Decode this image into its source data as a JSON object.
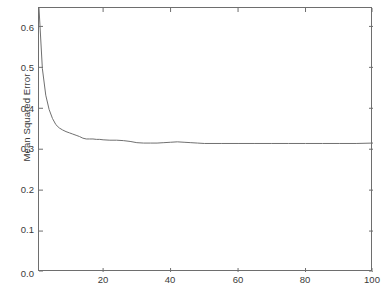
{
  "chart_data": {
    "type": "line",
    "title": "",
    "xlabel": "Number of Models in Ensemble",
    "ylabel": "Mean Squared Error",
    "xlim": [
      1,
      100
    ],
    "ylim": [
      0.0,
      0.645
    ],
    "grid": false,
    "legend": null,
    "line_color": "#707070",
    "line_width": 1,
    "xticks": [
      20,
      40,
      60,
      80,
      100
    ],
    "xtick_labels": [
      "20",
      "40",
      "60",
      "80",
      "100"
    ],
    "yticks": [
      0.0,
      0.1,
      0.2,
      0.3,
      0.4,
      0.5,
      0.6
    ],
    "ytick_labels": [
      "0.0",
      "0.1",
      "0.2",
      "0.3",
      "0.4",
      "0.5",
      "0.6"
    ],
    "series": [
      {
        "name": "Mean Squared Error",
        "x": [
          1,
          2,
          3,
          4,
          5,
          6,
          7,
          8,
          9,
          10,
          11,
          12,
          13,
          14,
          15,
          16,
          17,
          18,
          19,
          20,
          22,
          24,
          26,
          28,
          30,
          32,
          34,
          36,
          38,
          40,
          42,
          44,
          46,
          48,
          50,
          55,
          60,
          65,
          70,
          75,
          80,
          85,
          90,
          95,
          100
        ],
        "y": [
          0.645,
          0.497,
          0.432,
          0.397,
          0.375,
          0.36,
          0.352,
          0.347,
          0.343,
          0.34,
          0.337,
          0.334,
          0.331,
          0.327,
          0.325,
          0.325,
          0.325,
          0.324,
          0.324,
          0.323,
          0.322,
          0.322,
          0.321,
          0.319,
          0.316,
          0.315,
          0.315,
          0.315,
          0.316,
          0.317,
          0.318,
          0.317,
          0.316,
          0.315,
          0.314,
          0.314,
          0.314,
          0.314,
          0.314,
          0.314,
          0.314,
          0.314,
          0.314,
          0.314,
          0.315
        ]
      }
    ]
  },
  "axis": {
    "y_title": "Mean Squared Error",
    "x_title": "Number of Models in Ensemble"
  }
}
